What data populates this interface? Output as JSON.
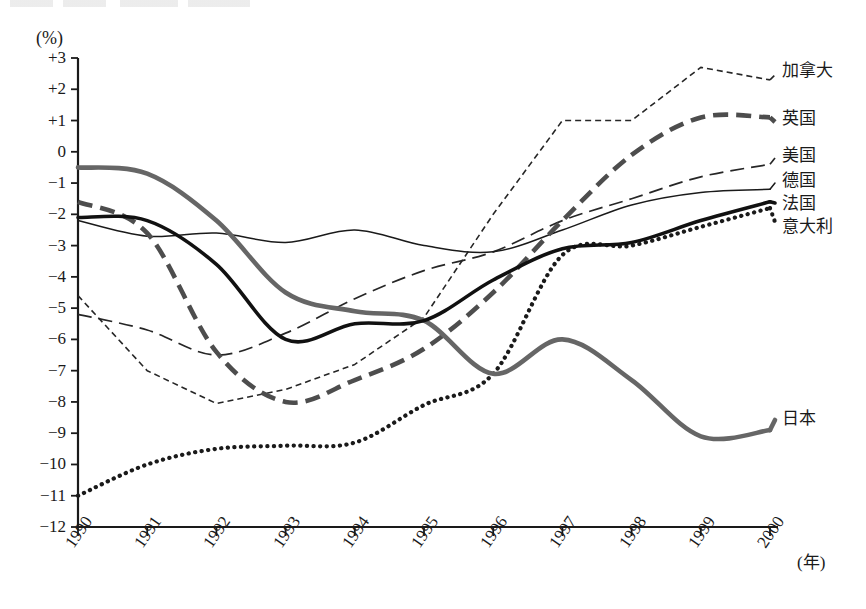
{
  "axes": {
    "y_unit_label": "(%)",
    "x_unit_label": "(年)",
    "y_ticks": [
      "+3",
      "+2",
      "+1",
      "0",
      "−1",
      "−2",
      "−3",
      "−4",
      "−5",
      "−6",
      "−7",
      "−8",
      "−9",
      "−10",
      "−11",
      "−12"
    ],
    "x_ticks": [
      "1990",
      "1991",
      "1992",
      "1993",
      "1994",
      "1995",
      "1996",
      "1997",
      "1998",
      "1999",
      "2000"
    ]
  },
  "labels": {
    "canada": "加拿大",
    "uk": "英国",
    "usa": "美国",
    "germany": "德国",
    "france": "法国",
    "italy": "意大利",
    "japan": "日本"
  },
  "chart_data": {
    "type": "line",
    "title": "",
    "xlabel": "(年)",
    "ylabel": "(%)",
    "xlim": [
      1990,
      2000
    ],
    "ylim": [
      -12,
      3
    ],
    "grid": false,
    "legend_position": "right-inline",
    "x": [
      1990,
      1991,
      1992,
      1993,
      1994,
      1995,
      1996,
      1997,
      1998,
      1999,
      2000
    ],
    "series": [
      {
        "name": "加拿大",
        "key": "canada",
        "style": "fine-dashed",
        "color": "#262626",
        "values": [
          -4.6,
          -7.0,
          -8.05,
          -7.6,
          -6.8,
          -5.3,
          -2.0,
          1.0,
          1.0,
          2.7,
          2.3
        ]
      },
      {
        "name": "英国",
        "key": "uk",
        "style": "thick-dashed-gray",
        "color": "#4d4d4d",
        "values": [
          -1.6,
          -2.6,
          -6.4,
          -8.0,
          -7.3,
          -6.3,
          -4.5,
          -2.2,
          -0.1,
          1.1,
          1.1
        ]
      },
      {
        "name": "美国",
        "key": "usa",
        "style": "long-dashed",
        "color": "#262626",
        "values": [
          -5.2,
          -5.7,
          -6.5,
          -5.8,
          -4.7,
          -3.8,
          -3.2,
          -2.2,
          -1.5,
          -0.8,
          -0.4
        ]
      },
      {
        "name": "德国",
        "key": "germany",
        "style": "thin-solid",
        "color": "#1a1a1a",
        "values": [
          -2.2,
          -2.7,
          -2.6,
          -2.9,
          -2.5,
          -3.0,
          -3.2,
          -2.5,
          -1.7,
          -1.3,
          -1.2
        ]
      },
      {
        "name": "法国",
        "key": "france",
        "style": "thick-solid",
        "color": "#111111",
        "values": [
          -2.1,
          -2.2,
          -3.6,
          -6.0,
          -5.5,
          -5.4,
          -4.1,
          -3.1,
          -2.9,
          -2.2,
          -1.6
        ]
      },
      {
        "name": "意大利",
        "key": "italy",
        "style": "dotted",
        "color": "#1a1a1a",
        "values": [
          -11.0,
          -10.0,
          -9.5,
          -9.4,
          -9.3,
          -8.1,
          -7.1,
          -3.3,
          -3.0,
          -2.4,
          -1.8
        ]
      },
      {
        "name": "日本",
        "key": "japan",
        "style": "thick-gray",
        "color": "#666666",
        "values": [
          -0.5,
          -0.7,
          -2.2,
          -4.5,
          -5.1,
          -5.4,
          -7.1,
          -6.0,
          -7.3,
          -9.1,
          -8.9
        ]
      }
    ]
  }
}
